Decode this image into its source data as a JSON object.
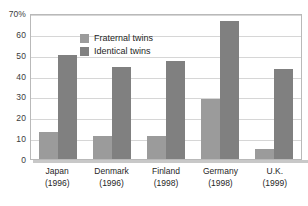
{
  "chart_data": {
    "type": "bar",
    "title": "",
    "xlabel": "",
    "ylabel": "",
    "ylim": [
      0,
      70
    ],
    "y_ticks": [
      0,
      10,
      20,
      30,
      40,
      50,
      60,
      70
    ],
    "y_tick_labels": [
      "0",
      "10",
      "20",
      "30",
      "40",
      "50",
      "60",
      "70%"
    ],
    "grid": true,
    "legend_position": "top-left-inside",
    "categories": [
      "Japan",
      "Denmark",
      "Finland",
      "Germany",
      "U.K."
    ],
    "category_years": [
      "(1996)",
      "(1996)",
      "(1998)",
      "(1998)",
      "(1999)"
    ],
    "series": [
      {
        "name": "Fraternal twins",
        "color": "#9b9b9b",
        "values": [
          13,
          11,
          11,
          29,
          5
        ]
      },
      {
        "name": "Identical twins",
        "color": "#808080",
        "values": [
          50,
          44,
          47,
          66,
          43
        ]
      }
    ]
  }
}
